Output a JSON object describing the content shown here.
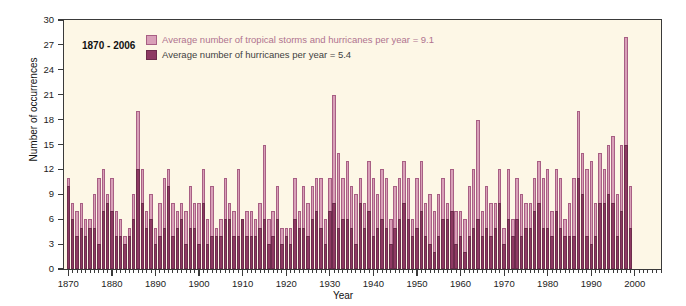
{
  "chart_data": {
    "type": "bar",
    "stacked": true,
    "title": "",
    "xlabel": "Year",
    "ylabel": "Number of occurrences",
    "ylim": [
      0,
      30
    ],
    "ytick_values": [
      0,
      3,
      6,
      9,
      12,
      15,
      18,
      21,
      24,
      27,
      30
    ],
    "ytick_labels": [
      "0",
      "3",
      "6",
      "9",
      "12",
      "15",
      "18",
      "21",
      "24",
      "27",
      "30"
    ],
    "xlim": [
      1869.5,
      2006.5
    ],
    "xtick_labels": [
      "1870",
      "1880",
      "1890",
      "1900",
      "1910",
      "1920",
      "1930",
      "1940",
      "1950",
      "1960",
      "1970",
      "1980",
      "1990",
      "2000"
    ],
    "xtick_values": [
      1870,
      1880,
      1890,
      1900,
      1910,
      1920,
      1930,
      1940,
      1950,
      1960,
      1970,
      1980,
      1990,
      2000
    ],
    "grid": false,
    "legend_position": "top-center",
    "range_note": "1870 - 2006",
    "series": [
      {
        "name": "Average number of tropical storms and hurricanes per year = 9.1",
        "short_name": "tropical storms and hurricanes",
        "color": "#d9a0b8",
        "average": 9.1,
        "values": [
          11,
          8,
          7,
          8,
          6,
          6,
          9,
          11,
          12,
          9,
          11,
          7,
          6,
          4,
          5,
          9,
          19,
          12,
          7,
          9,
          5,
          8,
          11,
          12,
          8,
          7,
          8,
          7,
          10,
          8,
          8,
          12,
          6,
          10,
          5,
          6,
          11,
          8,
          7,
          12,
          6,
          7,
          7,
          6,
          8,
          15,
          6,
          7,
          10,
          5,
          5,
          5,
          11,
          7,
          10,
          8,
          10,
          11,
          11,
          6,
          11,
          21,
          14,
          11,
          13,
          10,
          9,
          11,
          8,
          13,
          11,
          9,
          12,
          11,
          6,
          10,
          11,
          13,
          11,
          6,
          11,
          13,
          8,
          9,
          7,
          9,
          11,
          8,
          12,
          7,
          7,
          6,
          10,
          12,
          18,
          7,
          10,
          8,
          8,
          12,
          5,
          12,
          6,
          11,
          9,
          8,
          8,
          11,
          13,
          11,
          12,
          7,
          12,
          11,
          6,
          8,
          11,
          19,
          14,
          12,
          13,
          8,
          14,
          12,
          15,
          16,
          9,
          15,
          28,
          10
        ],
        "year_start": 1870
      },
      {
        "name": "Average number of hurricanes per year = 5.4",
        "short_name": "hurricanes",
        "color": "#8e3a63",
        "average": 5.4,
        "values": [
          10,
          6,
          4,
          5,
          4,
          5,
          5,
          3,
          7,
          8,
          7,
          4,
          4,
          3,
          4,
          6,
          12,
          8,
          5,
          6,
          3,
          4,
          5,
          10,
          4,
          5,
          6,
          3,
          5,
          5,
          3,
          8,
          3,
          4,
          4,
          4,
          6,
          6,
          4,
          4,
          6,
          4,
          4,
          4,
          5,
          6,
          3,
          4,
          6,
          3,
          4,
          3,
          6,
          5,
          5,
          4,
          6,
          7,
          5,
          3,
          7,
          8,
          5,
          6,
          6,
          5,
          3,
          8,
          5,
          7,
          4,
          5,
          6,
          5,
          3,
          5,
          6,
          8,
          6,
          4,
          5,
          7,
          4,
          3,
          2,
          4,
          6,
          6,
          7,
          3,
          4,
          2,
          4,
          5,
          6,
          4,
          5,
          4,
          5,
          8,
          3,
          6,
          4,
          6,
          4,
          5,
          5,
          7,
          8,
          5,
          5,
          4,
          7,
          5,
          4,
          4,
          4,
          11,
          9,
          4,
          3,
          4,
          8,
          8,
          9,
          8,
          4,
          7,
          15,
          5
        ],
        "year_start": 1870
      }
    ]
  },
  "axes": {
    "ylabel": "Number of occurrences",
    "xlabel": "Year"
  },
  "legend": {
    "rows": [
      {
        "label": "Average number of tropical storms and hurricanes per year = 9.1",
        "swatch": "light-pink-swatch"
      },
      {
        "label": "Average number of hurricanes per year = 5.4",
        "swatch": "dark-maroon-swatch"
      }
    ]
  },
  "annotation": {
    "range_note": "1870 - 2006"
  },
  "colors": {
    "plot_background": "#fdf7e6",
    "total_bar": "#d9a0b8",
    "hurricane_bar": "#8e3a63",
    "axis": "#3a3a3a",
    "legend_text_light": "#b0738f",
    "legend_text_dark": "#3f3f3f"
  }
}
